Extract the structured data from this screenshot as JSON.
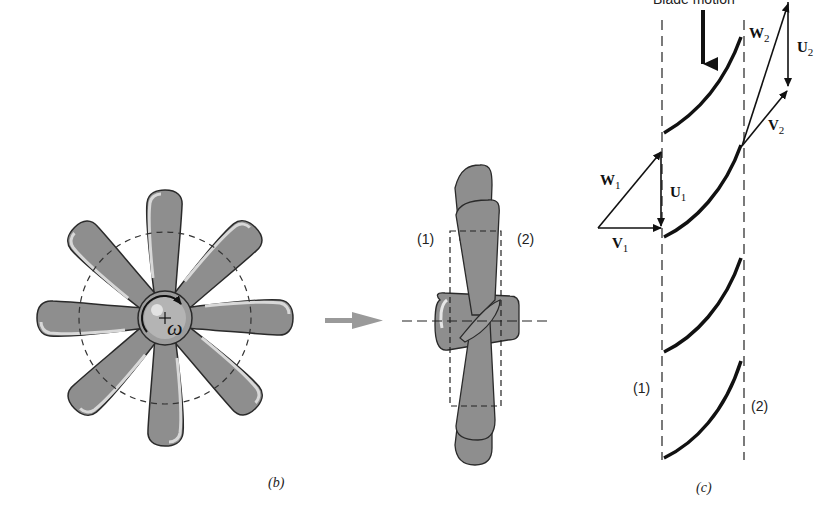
{
  "figure": {
    "panel_b": {
      "caption": "(b)",
      "omega_label": "ω",
      "section_1": "(1)",
      "section_2": "(2)",
      "blade_count": 8
    },
    "panel_c": {
      "caption": "(c)",
      "blade_motion_label": "Blade motion",
      "section_1": "(1)",
      "section_2": "(2)",
      "vectors": {
        "W1": {
          "letter": "W",
          "sub": "1"
        },
        "U1": {
          "letter": "U",
          "sub": "1"
        },
        "V1": {
          "letter": "V",
          "sub": "1"
        },
        "W2": {
          "letter": "W",
          "sub": "2"
        },
        "U2": {
          "letter": "U",
          "sub": "2"
        },
        "V2": {
          "letter": "V",
          "sub": "2"
        }
      }
    },
    "colors": {
      "blade_fill": "#8e8e8e",
      "blade_highlight": "#d8d8d8",
      "outline": "#2a2a2a",
      "arrow_gray": "#9a9a9a"
    }
  }
}
